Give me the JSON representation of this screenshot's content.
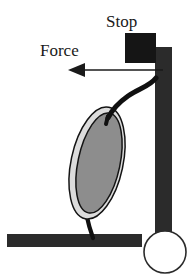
{
  "figure": {
    "type": "mechanics-schematic",
    "background_color": "#ffffff",
    "labels": {
      "stop": "Stop",
      "force": "Force"
    },
    "colors": {
      "dark_fill": "#2b2b2b",
      "outline": "#1a1a1a",
      "inner_ellipse_fill": "#8d8d8d",
      "outer_ellipse_fill": "#dcdcdc",
      "circle_fill": "#ffffff",
      "arrow": "#1a1a1a"
    },
    "elements": {
      "stop_block": {
        "name": "Stop block",
        "shape": "square",
        "x": 125,
        "y": 33,
        "width": 31,
        "height": 30
      },
      "vertical_post": {
        "name": "Vertical post",
        "shape": "rectangle",
        "x": 155,
        "y": 47,
        "width": 17,
        "height": 191
      },
      "base_bar": {
        "name": "Horizontal base",
        "shape": "rectangle",
        "x": 7,
        "y": 234,
        "width": 135,
        "height": 13
      },
      "wheel_circle": {
        "name": "Circle",
        "shape": "circle",
        "cx": 165,
        "cy": 252,
        "r": 21
      },
      "outer_ellipse": {
        "name": "Outer ellipse",
        "cx": 97,
        "cy": 163,
        "rx": 26,
        "ry": 57,
        "rotation_deg": 12
      },
      "inner_ellipse": {
        "name": "Inner ellipse",
        "cx": 98,
        "cy": 163,
        "rx": 21,
        "ry": 51,
        "rotation_deg": 12
      },
      "force_arrow": {
        "name": "Force arrow",
        "direction": "left",
        "tail_x": 163,
        "tip_x": 68,
        "y": 70
      },
      "upper_stem": {
        "name": "Upper curved stem"
      },
      "lower_stem": {
        "name": "Lower stem"
      }
    }
  }
}
